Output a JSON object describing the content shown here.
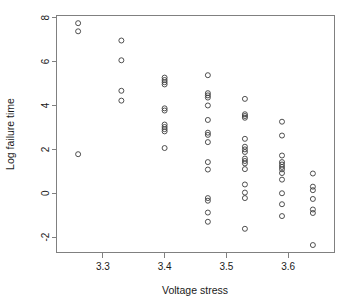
{
  "chart_data": {
    "type": "scatter",
    "title": "",
    "xlabel": "Voltage stress",
    "ylabel": "Log failure time",
    "xlim": [
      3.225,
      3.675
    ],
    "ylim": [
      -2.7,
      8.1
    ],
    "xticks": [
      3.3,
      3.4,
      3.5,
      3.6
    ],
    "xtick_labels": [
      "3.3",
      "3.4",
      "3.5",
      "3.6"
    ],
    "yticks": [
      -2,
      0,
      2,
      4,
      6,
      8
    ],
    "ytick_labels": [
      "-2",
      "0",
      "2",
      "4",
      "6",
      "8"
    ],
    "grid": false,
    "legend": null,
    "marker": "open-circle",
    "marker_color": "#3c3c3c",
    "frame": true,
    "points": [
      {
        "x": 3.26,
        "y": 7.75
      },
      {
        "x": 3.26,
        "y": 7.38
      },
      {
        "x": 3.26,
        "y": 1.78
      },
      {
        "x": 3.33,
        "y": 6.96
      },
      {
        "x": 3.33,
        "y": 6.06
      },
      {
        "x": 3.33,
        "y": 4.67
      },
      {
        "x": 3.33,
        "y": 4.22
      },
      {
        "x": 3.4,
        "y": 5.27
      },
      {
        "x": 3.4,
        "y": 5.16
      },
      {
        "x": 3.4,
        "y": 5.06
      },
      {
        "x": 3.4,
        "y": 4.96
      },
      {
        "x": 3.4,
        "y": 3.87
      },
      {
        "x": 3.4,
        "y": 3.77
      },
      {
        "x": 3.4,
        "y": 3.13
      },
      {
        "x": 3.4,
        "y": 3.02
      },
      {
        "x": 3.4,
        "y": 2.92
      },
      {
        "x": 3.4,
        "y": 2.82
      },
      {
        "x": 3.4,
        "y": 2.06
      },
      {
        "x": 3.47,
        "y": 5.38
      },
      {
        "x": 3.47,
        "y": 4.56
      },
      {
        "x": 3.47,
        "y": 4.46
      },
      {
        "x": 3.47,
        "y": 4.36
      },
      {
        "x": 3.47,
        "y": 4.0
      },
      {
        "x": 3.47,
        "y": 3.34
      },
      {
        "x": 3.47,
        "y": 2.76
      },
      {
        "x": 3.47,
        "y": 2.66
      },
      {
        "x": 3.47,
        "y": 2.33
      },
      {
        "x": 3.47,
        "y": 1.42
      },
      {
        "x": 3.47,
        "y": 1.08
      },
      {
        "x": 3.47,
        "y": -0.22
      },
      {
        "x": 3.47,
        "y": -0.34
      },
      {
        "x": 3.47,
        "y": -0.88
      },
      {
        "x": 3.47,
        "y": -1.3
      },
      {
        "x": 3.53,
        "y": 4.3
      },
      {
        "x": 3.53,
        "y": 3.6
      },
      {
        "x": 3.53,
        "y": 3.52
      },
      {
        "x": 3.53,
        "y": 3.44
      },
      {
        "x": 3.53,
        "y": 2.48
      },
      {
        "x": 3.53,
        "y": 2.12
      },
      {
        "x": 3.53,
        "y": 2.0
      },
      {
        "x": 3.53,
        "y": 1.88
      },
      {
        "x": 3.53,
        "y": 1.58
      },
      {
        "x": 3.53,
        "y": 1.47
      },
      {
        "x": 3.53,
        "y": 1.36
      },
      {
        "x": 3.53,
        "y": 1.1
      },
      {
        "x": 3.53,
        "y": 0.4
      },
      {
        "x": 3.53,
        "y": 0.03
      },
      {
        "x": 3.53,
        "y": -0.22
      },
      {
        "x": 3.53,
        "y": -1.62
      },
      {
        "x": 3.59,
        "y": 3.26
      },
      {
        "x": 3.59,
        "y": 2.63
      },
      {
        "x": 3.59,
        "y": 1.72
      },
      {
        "x": 3.59,
        "y": 1.42
      },
      {
        "x": 3.59,
        "y": 1.31
      },
      {
        "x": 3.59,
        "y": 1.2
      },
      {
        "x": 3.59,
        "y": 1.09
      },
      {
        "x": 3.59,
        "y": 0.92
      },
      {
        "x": 3.59,
        "y": 0.62
      },
      {
        "x": 3.59,
        "y": 0.0
      },
      {
        "x": 3.59,
        "y": -0.5
      },
      {
        "x": 3.59,
        "y": -1.04
      },
      {
        "x": 3.64,
        "y": 0.9
      },
      {
        "x": 3.64,
        "y": 0.3
      },
      {
        "x": 3.64,
        "y": 0.14
      },
      {
        "x": 3.64,
        "y": -0.26
      },
      {
        "x": 3.64,
        "y": -0.74
      },
      {
        "x": 3.64,
        "y": -0.9
      },
      {
        "x": 3.64,
        "y": -2.36
      }
    ]
  }
}
